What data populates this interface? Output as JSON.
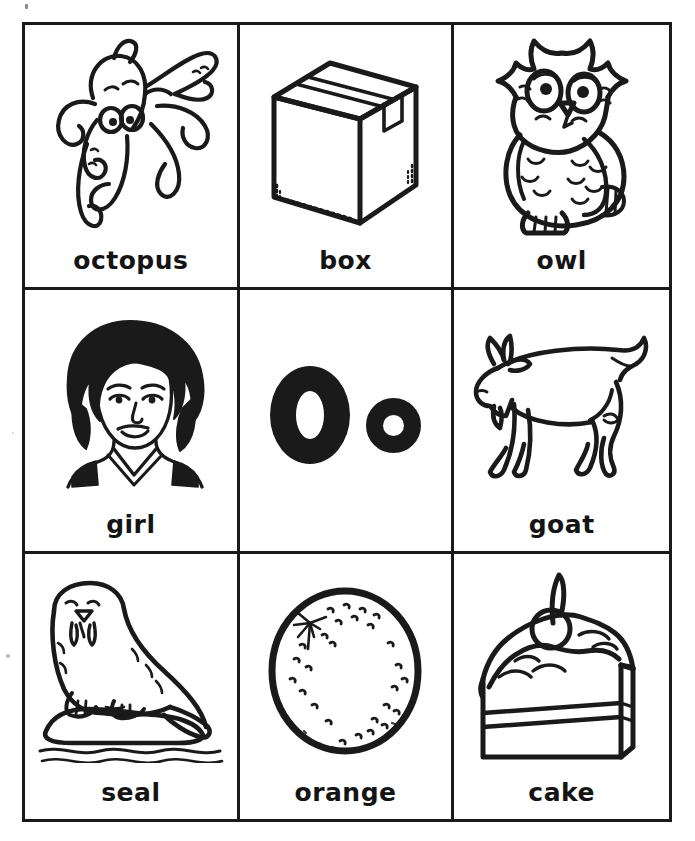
{
  "page": {
    "ink_color": "#1a1a1a",
    "paper_color": "#ffffff",
    "rows": 3,
    "columns": 3
  },
  "letter_focus": {
    "uppercase": "O",
    "lowercase": "o",
    "pair": "Oo"
  },
  "cells": [
    {
      "position": "row1-col1",
      "label": "octopus",
      "icon": "octopus-illustration"
    },
    {
      "position": "row1-col2",
      "label": "box",
      "icon": "cardboard-box-illustration"
    },
    {
      "position": "row1-col3",
      "label": "owl",
      "icon": "owl-illustration"
    },
    {
      "position": "row2-col1",
      "label": "girl",
      "icon": "girl-face-illustration"
    },
    {
      "position": "row2-col2",
      "label": "",
      "icon": "letter-oo-glyphs"
    },
    {
      "position": "row2-col3",
      "label": "goat",
      "icon": "goat-illustration"
    },
    {
      "position": "row3-col1",
      "label": "seal",
      "icon": "seal-on-ice-illustration"
    },
    {
      "position": "row3-col2",
      "label": "orange",
      "icon": "orange-fruit-illustration"
    },
    {
      "position": "row3-col3",
      "label": "cake",
      "icon": "cake-slice-illustration"
    }
  ]
}
